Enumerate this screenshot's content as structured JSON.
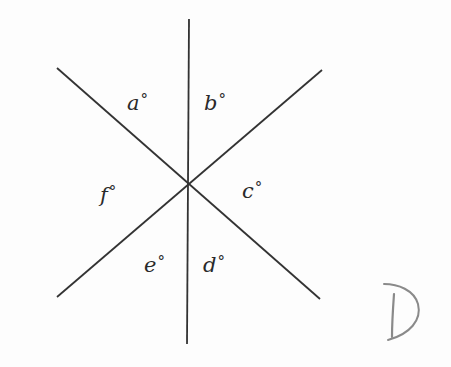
{
  "diagram": {
    "line_color": "#333333",
    "intersection": {
      "x": 188,
      "y": 183
    },
    "lines": [
      {
        "name": "vertical-line",
        "x1": 189,
        "y1": 19,
        "x2": 187,
        "y2": 344
      },
      {
        "name": "diagonal-line-descending",
        "x1": 57,
        "y1": 68,
        "x2": 320,
        "y2": 299
      },
      {
        "name": "diagonal-line-ascending",
        "x1": 322,
        "y1": 70,
        "x2": 57,
        "y2": 297
      }
    ],
    "angles": [
      {
        "letter": "a",
        "degree_symbol": "°",
        "x": 127,
        "y": 92
      },
      {
        "letter": "b",
        "degree_symbol": "°",
        "x": 204,
        "y": 92
      },
      {
        "letter": "c",
        "degree_symbol": "°",
        "x": 242,
        "y": 180
      },
      {
        "letter": "d",
        "degree_symbol": "°",
        "x": 203,
        "y": 254
      },
      {
        "letter": "e",
        "degree_symbol": "°",
        "x": 144,
        "y": 254
      },
      {
        "letter": "f",
        "degree_symbol": "°",
        "x": 100,
        "y": 184
      }
    ],
    "answer_mark": {
      "text": "D",
      "color": "#8a8a8a",
      "style": "handwritten"
    }
  }
}
